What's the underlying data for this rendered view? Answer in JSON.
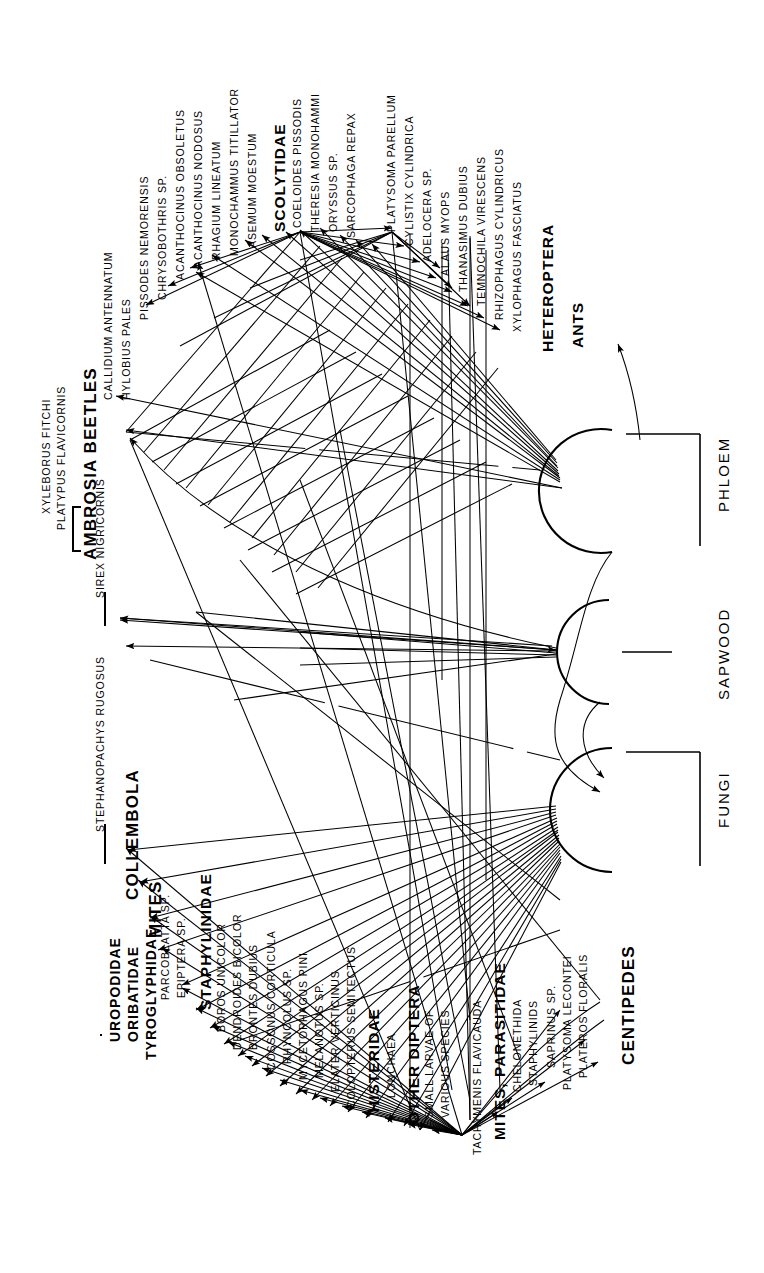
{
  "figure": {
    "type": "food-web-diagram",
    "orientation": "rotated-90-ccw",
    "background": "#ffffff",
    "ink": "#000000"
  },
  "nodes": [
    {
      "id": "phloem",
      "label": "PHLOEM",
      "underlined": true
    },
    {
      "id": "sapwood",
      "label": "SAPWOOD",
      "underlined": true
    },
    {
      "id": "fungi",
      "label": "FUNGI",
      "underlined": true
    }
  ],
  "top_labels": [
    {
      "text": "CALLIDIUM ANTENNATUM",
      "style": "sp"
    },
    {
      "text": "HYLOBIUS PALES",
      "style": "sp"
    },
    {
      "text": "PISSODES NEMORENSIS",
      "style": "sp"
    },
    {
      "text": "CHRYSOBOTHRIS SP.",
      "style": "sp"
    },
    {
      "text": "ACANTHOCINUS OBSOLETUS",
      "style": "sp"
    },
    {
      "text": "ACANTHOCINUS NODOSUS",
      "style": "sp"
    },
    {
      "text": "RHAGIUM LINEATUM",
      "style": "sp"
    },
    {
      "text": "MONOCHAMMUS  TITILLATOR",
      "style": "sp"
    },
    {
      "text": "ASEMUM MOESTUM",
      "style": "sp"
    },
    {
      "text": "SCOLYTIDAE",
      "style": "grp"
    },
    {
      "text": "COELOIDES PISSODIS",
      "style": "sp"
    },
    {
      "text": "THERESIA MONOHAMMI",
      "style": "sp"
    },
    {
      "text": "ORYSSUS SP.",
      "style": "sp"
    },
    {
      "text": "SARCOPHAGA  REPAX",
      "style": "sp"
    },
    {
      "text": "PLATYSOMA PARELLUM",
      "style": "sp"
    },
    {
      "text": "CYLISTIX CYLINDRICA",
      "style": "sp"
    },
    {
      "text": "ADELOCERA SP.",
      "style": "sp"
    },
    {
      "text": "ALAUS MYOPS",
      "style": "sp"
    },
    {
      "text": "THANASIMUS DUBIUS",
      "style": "sp"
    },
    {
      "text": "TEMNOCHILA VIRESCENS",
      "style": "sp"
    },
    {
      "text": "RHIZOPHAGUS CYLINDRICUS",
      "style": "sp"
    },
    {
      "text": "XYLOPHAGUS FASCIATUS",
      "style": "sp"
    },
    {
      "text": "HETEROPTERA",
      "style": "grp"
    },
    {
      "text": "ANTS",
      "style": "grp"
    }
  ],
  "left_labels": [
    {
      "text": "XYLEBORUS FITCHI",
      "style": "sp"
    },
    {
      "text": "PLATYPUS  FLAVICORNIS",
      "style": "sp"
    },
    {
      "text": "AMBROSIA BEETLES",
      "style": "big"
    },
    {
      "text": "SIREX NIGRICORNIS",
      "style": "sp"
    },
    {
      "text": "STEPHANOPACHYS RUGOSUS",
      "style": "sp"
    }
  ],
  "bottom_labels": [
    {
      "text": "UROPODIDAE",
      "style": "grp2"
    },
    {
      "text": "ORIBATIDAE",
      "style": "grp2"
    },
    {
      "text": "TYROGLYPHIDAE",
      "style": "grp2"
    },
    {
      "text": "COLLEMBOLA",
      "style": "big"
    },
    {
      "text": "MITES",
      "style": "big"
    },
    {
      "text": "PARCOBLATTA SP.",
      "style": "sp"
    },
    {
      "text": "EPIPTERA SP.",
      "style": "sp"
    },
    {
      "text": "STAPHYLINIDAE",
      "style": "grp"
    },
    {
      "text": "BOROS UNICOLOR",
      "style": "sp"
    },
    {
      "text": "DENDROIDES BICOLOR",
      "style": "sp"
    },
    {
      "text": "BRONTES DUBIUS",
      "style": "sp"
    },
    {
      "text": "COSSONUS CORTICULA",
      "style": "sp"
    },
    {
      "text": "RHYNCOLUS SP.",
      "style": "sp"
    },
    {
      "text": "MYCETOPHAGUS PINI",
      "style": "sp"
    },
    {
      "text": "MELANOTUS SP.",
      "style": "sp"
    },
    {
      "text": "ELATER VERTICINUS",
      "style": "sp"
    },
    {
      "text": "COLOPTERUS SEMITECTUS",
      "style": "sp"
    },
    {
      "text": "HISTERIDAE",
      "style": "grp"
    },
    {
      "text": "LONCHAEA",
      "style": "sp"
    },
    {
      "text": "OTHER DIPTERA",
      "style": "grp"
    },
    {
      "text": "SMALL LARVAE OF",
      "style": "sp"
    },
    {
      "text": "VARIOUS SPECIES",
      "style": "sp"
    },
    {
      "text": "TACHYMENIS FLAVICAUDA",
      "style": "sp"
    },
    {
      "text": "MITES, PARASITIDAE",
      "style": "grp"
    },
    {
      "text": "CHELONETHIDA",
      "style": "sp"
    },
    {
      "text": "STAPHYLINIDS",
      "style": "sp"
    },
    {
      "text": "SAPRINUS SP.",
      "style": "sp"
    },
    {
      "text": "PLATYSOMA LECONTEI",
      "style": "sp"
    },
    {
      "text": "PLATEROS FLORALIS",
      "style": "sp"
    },
    {
      "text": "CENTIPEDES",
      "style": "big"
    }
  ]
}
